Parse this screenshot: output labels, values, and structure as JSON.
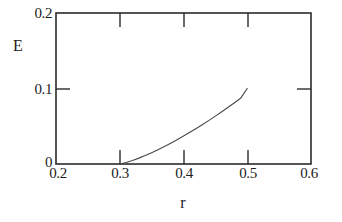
{
  "chart_data": {
    "type": "line",
    "title": "",
    "xlabel": "r",
    "ylabel": "E",
    "xlim": [
      0.2,
      0.6
    ],
    "ylim": [
      0.0,
      0.2
    ],
    "grid": false,
    "legend": null,
    "x_ticks": [
      {
        "value": 0.2,
        "label": "0.2"
      },
      {
        "value": 0.3,
        "label": "0.3"
      },
      {
        "value": 0.4,
        "label": "0.4"
      },
      {
        "value": 0.5,
        "label": "0.5"
      },
      {
        "value": 0.6,
        "label": "0.6"
      }
    ],
    "y_ticks": [
      {
        "value": 0.0,
        "label": "0"
      },
      {
        "value": 0.1,
        "label": "0.1"
      },
      {
        "value": 0.2,
        "label": "0.2"
      }
    ],
    "series": [
      {
        "name": "E(r)",
        "color": "#4a4a4a",
        "x": [
          0.3,
          0.31,
          0.32,
          0.33,
          0.34,
          0.35,
          0.36,
          0.37,
          0.38,
          0.39,
          0.4,
          0.41,
          0.42,
          0.43,
          0.44,
          0.45,
          0.46,
          0.47,
          0.48,
          0.49,
          0.5
        ],
        "y": [
          0.0,
          0.002,
          0.0047,
          0.0078,
          0.0112,
          0.015,
          0.019,
          0.0232,
          0.0276,
          0.0322,
          0.037,
          0.042,
          0.0471,
          0.0524,
          0.0578,
          0.0634,
          0.0692,
          0.0751,
          0.0812,
          0.0875,
          0.1
        ]
      }
    ],
    "annotations": []
  },
  "axes": {
    "x_title": "r",
    "y_title": "E",
    "x_tick_labels": [
      "0.2",
      "0.3",
      "0.4",
      "0.5",
      "0.6"
    ],
    "y_tick_labels": [
      "0",
      "0.1",
      "0.2"
    ]
  }
}
